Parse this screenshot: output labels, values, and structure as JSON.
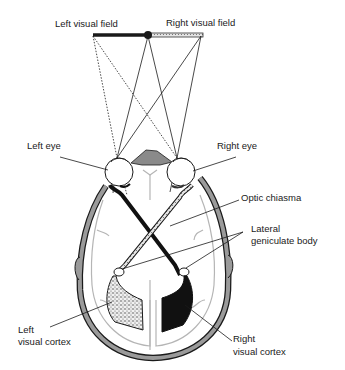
{
  "diagram": {
    "type": "visual-pathway",
    "labels": {
      "left_visual_field": "Left visual field",
      "right_visual_field": "Right visual field",
      "left_eye": "Left eye",
      "right_eye": "Right eye",
      "optic_chiasma": "Optic chiasma",
      "lateral_geniculate_body_line1": "Lateral",
      "lateral_geniculate_body_line2": "geniculate body",
      "left_visual_cortex_line1": "Left",
      "left_visual_cortex_line2": "visual cortex",
      "right_visual_cortex_line1": "Right",
      "right_visual_cortex_line2": "visual cortex"
    },
    "colors": {
      "ink": "#1a1a1a",
      "skull_fill": "#9a9a9a",
      "brain_outline": "#b5b5b5",
      "left_pathway_fill": "#d8d8d8",
      "right_pathway_fill": "#111111"
    }
  }
}
